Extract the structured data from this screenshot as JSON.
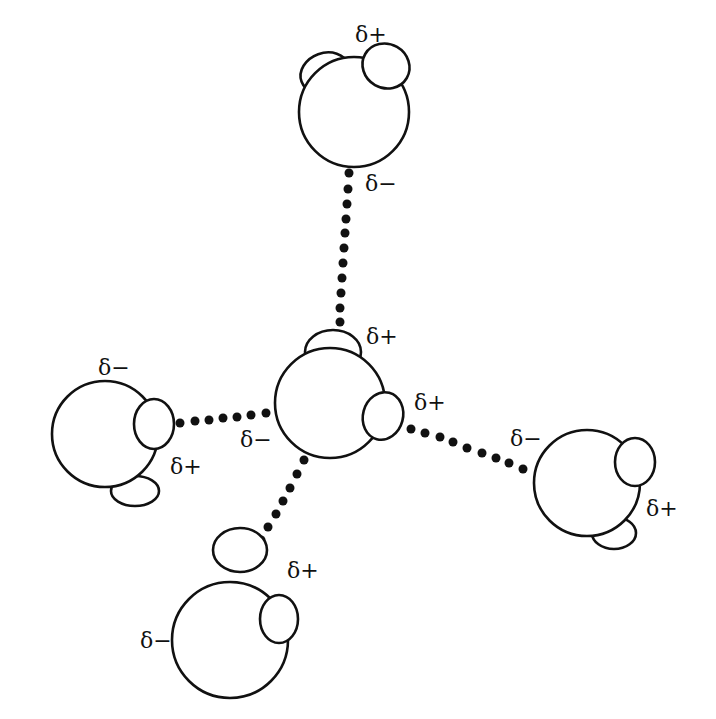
{
  "diagram": {
    "title": "",
    "labels": {
      "top_plus": "δ+",
      "top_minus": "δ−",
      "center_plus_top": "δ+",
      "center_plus_right": "δ+",
      "center_minus": "δ−",
      "left_minus": "δ−",
      "left_plus": "δ+",
      "right_minus": "δ−",
      "right_plus": "δ+",
      "bottom_plus": "δ+",
      "bottom_minus": "δ−"
    },
    "colors": {
      "stroke": "#111111",
      "fill": "#ffffff"
    }
  }
}
